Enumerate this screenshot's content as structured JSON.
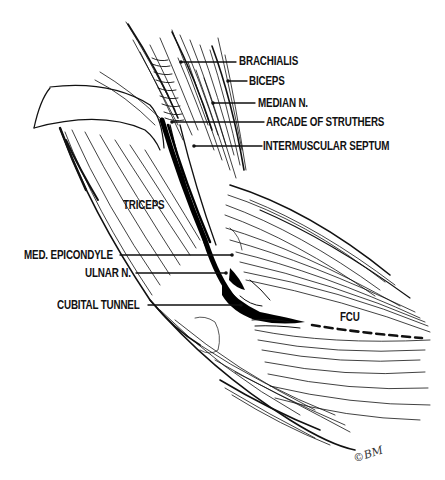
{
  "figure": {
    "type": "anatomical line illustration",
    "background": "#ffffff",
    "ink": "#111111"
  },
  "labels": {
    "brachialis": "BRACHIALIS",
    "biceps": "BICEPS",
    "median_n": "MEDIAN N.",
    "arcade_of_struthers": "ARCADE OF STRUTHERS",
    "intermuscular_septum": "INTERMUSCULAR SEPTUM",
    "triceps": "TRICEPS",
    "med_epicondyle": "MED. EPICONDYLE",
    "ulnar_n": "ULNAR N.",
    "cubital_tunnel": "CUBITAL TUNNEL",
    "fcu": "FCU"
  },
  "signature": "©BM"
}
